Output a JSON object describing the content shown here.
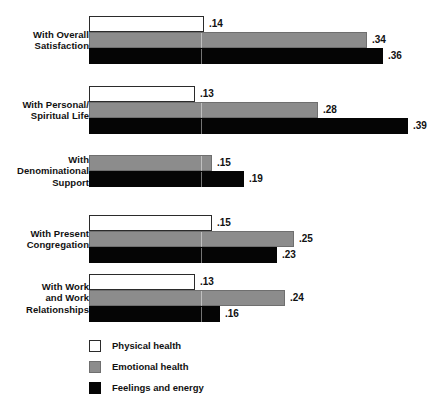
{
  "chart_data": {
    "type": "bar",
    "orientation": "horizontal",
    "title": "",
    "subtitle": "",
    "xlabel": "",
    "ylabel": "",
    "grid": false,
    "xlim": [
      0,
      0.42
    ],
    "legend_position": "bottom-left",
    "categories": [
      "With Overall\nSatisfaction",
      "With Personal/\nSpiritual Life",
      "With\nDenominational\nSupport",
      "With Present\nCongregation",
      "With Work\nand Work\nRelationships"
    ],
    "series": [
      {
        "name": "Physical health",
        "color": "#ffffff",
        "values": [
          0.14,
          0.13,
          null,
          0.15,
          0.13
        ],
        "labels": [
          ".14",
          ".13",
          "",
          ".15",
          ".13"
        ]
      },
      {
        "name": "Emotional health",
        "color": "#8c8c8c",
        "values": [
          0.34,
          0.28,
          0.15,
          0.25,
          0.24
        ],
        "labels": [
          ".34",
          ".28",
          ".15",
          ".25",
          ".24"
        ]
      },
      {
        "name": "Feelings and energy",
        "color": "#050505",
        "values": [
          0.36,
          0.39,
          0.19,
          0.23,
          0.16
        ],
        "labels": [
          ".36",
          ".39",
          ".19",
          ".23",
          ".16"
        ]
      }
    ]
  },
  "groups": [
    {
      "label_lines": [
        "With Overall",
        "Satisfaction"
      ],
      "bars": [
        {
          "series": "Physical health",
          "style": "white",
          "value": 0.14,
          "label": ".14"
        },
        {
          "series": "Emotional health",
          "style": "gray",
          "value": 0.34,
          "label": ".34"
        },
        {
          "series": "Feelings and energy",
          "style": "black",
          "value": 0.36,
          "label": ".36"
        }
      ]
    },
    {
      "label_lines": [
        "With Personal/",
        "Spiritual Life"
      ],
      "bars": [
        {
          "series": "Physical health",
          "style": "white",
          "value": 0.13,
          "label": ".13"
        },
        {
          "series": "Emotional health",
          "style": "gray",
          "value": 0.28,
          "label": ".28"
        },
        {
          "series": "Feelings and energy",
          "style": "black",
          "value": 0.39,
          "label": ".39"
        }
      ]
    },
    {
      "label_lines": [
        "With",
        "Denominational",
        "Support"
      ],
      "bars": [
        {
          "series": "Emotional health",
          "style": "gray",
          "value": 0.15,
          "label": ".15"
        },
        {
          "series": "Feelings and energy",
          "style": "black",
          "value": 0.19,
          "label": ".19"
        }
      ]
    },
    {
      "label_lines": [
        "With Present",
        "Congregation"
      ],
      "bars": [
        {
          "series": "Physical health",
          "style": "white",
          "value": 0.15,
          "label": ".15"
        },
        {
          "series": "Emotional health",
          "style": "gray",
          "value": 0.25,
          "label": ".25"
        },
        {
          "series": "Feelings and energy",
          "style": "black",
          "value": 0.23,
          "label": ".23"
        }
      ]
    },
    {
      "label_lines": [
        "With Work",
        "and Work",
        "Relationships"
      ],
      "bars": [
        {
          "series": "Physical health",
          "style": "white",
          "value": 0.13,
          "label": ".13"
        },
        {
          "series": "Emotional health",
          "style": "gray",
          "value": 0.24,
          "label": ".24"
        },
        {
          "series": "Feelings and energy",
          "style": "black",
          "value": 0.16,
          "label": ".16"
        }
      ]
    }
  ],
  "legend": {
    "items": [
      {
        "style": "white",
        "label": "Physical health"
      },
      {
        "style": "gray",
        "label": "Emotional health"
      },
      {
        "style": "black",
        "label": "Feelings and energy"
      }
    ]
  },
  "layout": {
    "bar_origin_x": 89,
    "px_per_unit": 818,
    "bar_height": 16,
    "group_tops": [
      16,
      86,
      155,
      215,
      274
    ],
    "tick_x": 200
  },
  "colors": {
    "physical": "#ffffff",
    "emotional": "#8c8c8c",
    "feelings": "#050505",
    "text": "#111111",
    "background": "#ffffff"
  }
}
